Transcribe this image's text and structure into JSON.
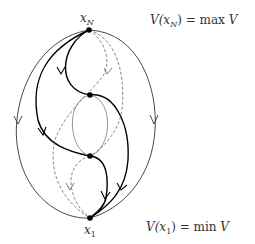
{
  "diagram": {
    "nodes": [
      {
        "id": "xN",
        "label_base": "x",
        "label_sub": "N",
        "x": 89,
        "y": 30
      },
      {
        "id": "upper",
        "x": 90,
        "y": 95
      },
      {
        "id": "lower",
        "x": 90,
        "y": 156
      },
      {
        "id": "x1",
        "label_base": "x",
        "label_sub": "1",
        "x": 90,
        "y": 218
      }
    ],
    "annotations": {
      "max": {
        "prefix": "V(",
        "var": "x",
        "sub": "N",
        "suffix": ") = max ",
        "tail": "V"
      },
      "min": {
        "prefix": "V(",
        "var": "x",
        "sub": "1",
        "suffix": ") = min ",
        "tail": "V"
      }
    },
    "colors": {
      "ink": "#000000",
      "thin": "#444444",
      "dashed": "#666666",
      "gray": "#888888"
    }
  }
}
